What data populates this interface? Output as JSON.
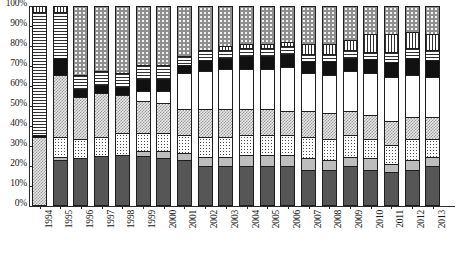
{
  "chart_data": {
    "type": "bar",
    "stacked": true,
    "normalized": "100%",
    "title": "",
    "subtitle": "",
    "xlabel": "",
    "ylabel": "",
    "ylim": [
      0,
      100
    ],
    "grid": false,
    "legend_position": "none",
    "ytick_labels": [
      "0%",
      "10%",
      "20%",
      "30%",
      "40%",
      "50%",
      "60%",
      "70%",
      "80%",
      "90%",
      "100%"
    ],
    "ytick_values": [
      0,
      10,
      20,
      30,
      40,
      50,
      60,
      70,
      80,
      90,
      100
    ],
    "categories": [
      "1994",
      "1995",
      "1996",
      "1997",
      "1998",
      "1999",
      "2000",
      "2001",
      "2002",
      "2003",
      "2004",
      "2005",
      "2006",
      "2007",
      "2008",
      "2009",
      "2010",
      "2011",
      "2012",
      "2013"
    ],
    "series": [
      {
        "name": "series-1",
        "pattern": "dark-gray",
        "values": [
          0,
          22,
          23,
          24,
          25,
          24,
          23,
          22,
          19,
          19,
          19,
          19,
          19,
          17,
          17,
          19,
          17,
          16,
          17,
          19
        ]
      },
      {
        "name": "series-2",
        "pattern": "light-gray",
        "values": [
          0,
          2,
          0,
          0,
          0,
          3,
          4,
          4,
          5,
          5,
          6,
          6,
          6,
          6,
          5,
          5,
          6,
          4,
          5,
          5
        ]
      },
      {
        "name": "series-3",
        "pattern": "fine-dotted",
        "values": [
          0,
          10,
          10,
          10,
          11,
          9,
          9,
          9,
          10,
          10,
          10,
          10,
          10,
          11,
          11,
          11,
          10,
          10,
          11,
          9
        ]
      },
      {
        "name": "series-4",
        "pattern": "checkered",
        "values": [
          34,
          31,
          21,
          22,
          19,
          16,
          15,
          13,
          14,
          14,
          13,
          13,
          12,
          13,
          13,
          12,
          12,
          12,
          11,
          11
        ]
      },
      {
        "name": "series-5",
        "pattern": "white",
        "values": [
          0,
          0,
          0,
          0,
          0,
          5,
          6,
          18,
          19,
          20,
          20,
          20,
          22,
          19,
          19,
          20,
          21,
          22,
          21,
          20
        ]
      },
      {
        "name": "series-6",
        "pattern": "black",
        "values": [
          1,
          9,
          4,
          4,
          4,
          6,
          6,
          4,
          6,
          6,
          7,
          7,
          7,
          6,
          7,
          7,
          7,
          8,
          9,
          9
        ]
      },
      {
        "name": "series-7",
        "pattern": "horizontal-stripes",
        "values": [
          62,
          23,
          7,
          7,
          7,
          7,
          7,
          5,
          5,
          4,
          4,
          4,
          4,
          4,
          4,
          4,
          4,
          5,
          5,
          5
        ]
      },
      {
        "name": "series-8",
        "pattern": "vertical-stripes",
        "values": [
          3,
          3,
          0,
          0,
          0,
          0,
          0,
          0,
          0,
          2,
          2,
          2,
          2,
          5,
          5,
          5,
          9,
          9,
          8,
          8
        ]
      },
      {
        "name": "series-9",
        "pattern": "coarse-dots",
        "values": [
          0,
          0,
          35,
          33,
          34,
          30,
          30,
          25,
          22,
          20,
          19,
          19,
          18,
          19,
          19,
          17,
          14,
          14,
          13,
          14
        ]
      }
    ]
  },
  "caption": {
    "text": ""
  }
}
